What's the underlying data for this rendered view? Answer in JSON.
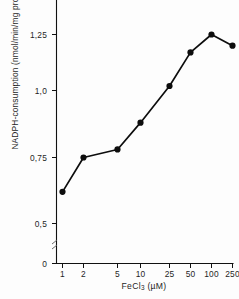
{
  "chart_data": {
    "type": "line",
    "title": "",
    "xlabel": "FeCl3 (µM)",
    "xlabel_base": "FeCl",
    "xlabel_sub": "3",
    "xlabel_unit": "(µM)",
    "ylabel": "NADPH-consumption (nmol/min/mg protein)",
    "categories": [
      "1",
      "2",
      "5",
      "10",
      "25",
      "50",
      "100",
      "250"
    ],
    "x": [
      1,
      2,
      5,
      10,
      25,
      50,
      100,
      250
    ],
    "values": [
      0.62,
      0.75,
      0.78,
      0.88,
      1.02,
      1.17,
      1.25,
      1.2
    ],
    "ytick_labels": [
      "0",
      "0,5",
      "0,75",
      "1,0",
      "1,25"
    ],
    "ytick_values": [
      0,
      0.5,
      0.75,
      1.0,
      1.25
    ],
    "ylim": [
      0,
      1.3
    ],
    "xscale": "categorical-log",
    "grid": false,
    "legend": null,
    "marker": "filled-circle",
    "axis_break": true,
    "line_color": "#0d0d0d",
    "marker_color": "#0d0d0d",
    "axis_color": "#111111",
    "background_color": "#fdfdfd"
  },
  "figure": {
    "name": "NADPH consumption vs FeCl3 concentration"
  }
}
